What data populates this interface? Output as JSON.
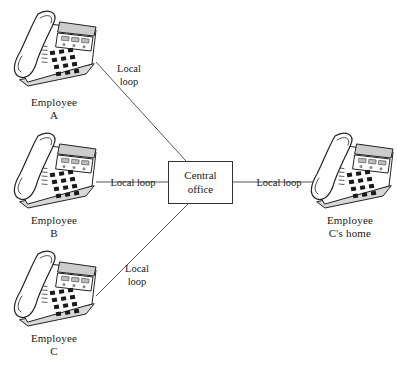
{
  "diagram": {
    "background_color": "#ffffff",
    "line_color": "#555555",
    "ink_color": "#1a1a1a"
  },
  "central_office": {
    "line1": "Central",
    "line2": "office"
  },
  "nodes": [
    {
      "id": "employee-a",
      "label_line1": "Employee",
      "label_line2": "A",
      "icon": "desk-telephone-icon"
    },
    {
      "id": "employee-b",
      "label_line1": "Employee",
      "label_line2": "B",
      "icon": "desk-telephone-icon"
    },
    {
      "id": "employee-c",
      "label_line1": "Employee",
      "label_line2": "C",
      "icon": "desk-telephone-icon"
    },
    {
      "id": "employee-c-home",
      "label_line1": "Employee",
      "label_line2": "C's home",
      "icon": "desk-telephone-icon"
    }
  ],
  "links": [
    {
      "id": "link-a",
      "label_line1": "Local",
      "label_line2": "loop"
    },
    {
      "id": "link-b",
      "label_line1": "Local loop",
      "label_line2": ""
    },
    {
      "id": "link-c",
      "label_line1": "Local",
      "label_line2": "loop"
    },
    {
      "id": "link-home",
      "label_line1": "Local loop",
      "label_line2": ""
    }
  ]
}
